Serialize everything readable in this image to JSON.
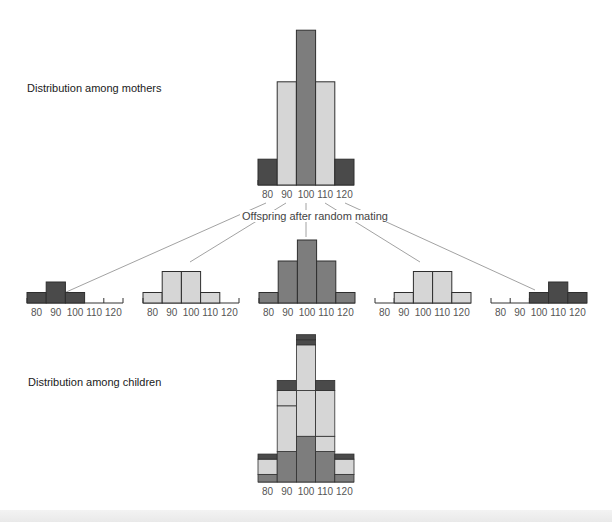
{
  "labels": {
    "mothers": "Distribution among mothers",
    "offspring": "Offspring after random mating",
    "children": "Distribution among children"
  },
  "colors": {
    "dark": "#4a4a4a",
    "medium": "#7d7d7d",
    "light": "#d6d6d6",
    "outline": "#2e2e2e",
    "line": "#8a8a8a"
  },
  "chart_data": [
    {
      "type": "bar",
      "title": "Distribution among mothers",
      "categories": [
        "80",
        "90",
        "100",
        "110",
        "120"
      ],
      "values": [
        1,
        4,
        6,
        4,
        1
      ],
      "bar_shades": [
        "dark",
        "light",
        "medium",
        "light",
        "dark"
      ]
    },
    {
      "type": "bar",
      "title": "Offspring of mothers at 80 (random mating)",
      "categories": [
        "80",
        "90",
        "100",
        "110",
        "120"
      ],
      "values": [
        1,
        2,
        1,
        0,
        0
      ],
      "bar_shade": "dark"
    },
    {
      "type": "bar",
      "title": "Offspring of mothers at 90 (random mating)",
      "categories": [
        "80",
        "90",
        "100",
        "110",
        "120"
      ],
      "values": [
        1,
        3,
        3,
        1,
        0
      ],
      "bar_shade": "light"
    },
    {
      "type": "bar",
      "title": "Offspring of mothers at 100 (random mating)",
      "categories": [
        "80",
        "90",
        "100",
        "110",
        "120"
      ],
      "values": [
        1,
        4,
        6,
        4,
        1
      ],
      "bar_shade": "medium"
    },
    {
      "type": "bar",
      "title": "Offspring of mothers at 110 (random mating)",
      "categories": [
        "80",
        "90",
        "100",
        "110",
        "120"
      ],
      "values": [
        0,
        1,
        3,
        3,
        1
      ],
      "bar_shade": "light"
    },
    {
      "type": "bar",
      "title": "Offspring of mothers at 120 (random mating)",
      "categories": [
        "80",
        "90",
        "100",
        "110",
        "120"
      ],
      "values": [
        0,
        0,
        1,
        2,
        1
      ],
      "bar_shade": "dark"
    },
    {
      "type": "bar",
      "stacked": true,
      "title": "Distribution among children",
      "categories": [
        "80",
        "90",
        "100",
        "110",
        "120"
      ],
      "series": [
        {
          "name": "from 100 mothers",
          "shade": "medium",
          "values": [
            6,
            24,
            36,
            24,
            6
          ]
        },
        {
          "name": "from 90 mothers",
          "shade": "light",
          "values": [
            12,
            36,
            36,
            12,
            0
          ]
        },
        {
          "name": "from 110 mothers",
          "shade": "light",
          "values": [
            0,
            12,
            36,
            36,
            12
          ]
        },
        {
          "name": "from 80 mothers",
          "shade": "dark",
          "values": [
            4,
            8,
            4,
            0,
            0
          ]
        },
        {
          "name": "from 120 mothers",
          "shade": "dark",
          "values": [
            0,
            0,
            4,
            8,
            4
          ]
        }
      ]
    }
  ]
}
